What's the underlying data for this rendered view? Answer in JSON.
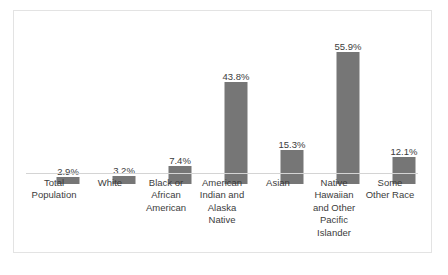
{
  "chart_data": {
    "type": "bar",
    "title": "",
    "subtitle": "",
    "xlabel": "",
    "ylabel": "",
    "ylim": [
      0,
      60
    ],
    "grid": false,
    "legend": "none",
    "orientation": "vertical",
    "bar_color": "#767676",
    "axis_color": "#d4d4d4",
    "frame_color": "#e3e3e3",
    "label_color": "#3c3c3c",
    "categories": [
      "Total Population",
      "White",
      "Black or African American",
      "American Indian and Alaska Native",
      "Asian",
      "Native Hawaiian and Other Pacific Islander",
      "Some Other Race"
    ],
    "category_lines": [
      [
        "Total",
        "Population"
      ],
      [
        "White"
      ],
      [
        "Black or",
        "African",
        "American"
      ],
      [
        "American",
        "Indian and",
        "Alaska",
        "Native"
      ],
      [
        "Asian"
      ],
      [
        "Native",
        "Hawaiian",
        "and Other",
        "Pacific",
        "Islander"
      ],
      [
        "Some",
        "Other Race"
      ]
    ],
    "values": [
      2.9,
      3.2,
      7.4,
      43.8,
      15.3,
      55.9,
      12.1
    ],
    "value_labels": [
      "2.9%",
      "3.2%",
      "7.4%",
      "43.8%",
      "15.3%",
      "55.9%",
      "12.1%"
    ],
    "ghost_top_text": ""
  },
  "bars": [
    {
      "label": "2.9%",
      "value": 2.9,
      "slot_left": 0,
      "height_px": 7,
      "label_top_px": 141
    },
    {
      "label": "3.2%",
      "value": 3.2,
      "slot_left": 56,
      "height_px": 8,
      "label_top_px": 140
    },
    {
      "label": "7.4%",
      "value": 7.4,
      "slot_left": 112,
      "height_px": 18,
      "label_top_px": 130
    },
    {
      "label": "43.8%",
      "value": 43.8,
      "slot_left": 168,
      "height_px": 102,
      "label_top_px": 46
    },
    {
      "label": "15.3%",
      "value": 15.3,
      "slot_left": 224,
      "height_px": 34,
      "label_top_px": 114
    },
    {
      "label": "55.9%",
      "value": 55.9,
      "slot_left": 280,
      "height_px": 132,
      "label_top_px": 16
    },
    {
      "label": "12.1%",
      "value": 12.1,
      "slot_left": 336,
      "height_px": 27,
      "label_top_px": 121
    }
  ]
}
